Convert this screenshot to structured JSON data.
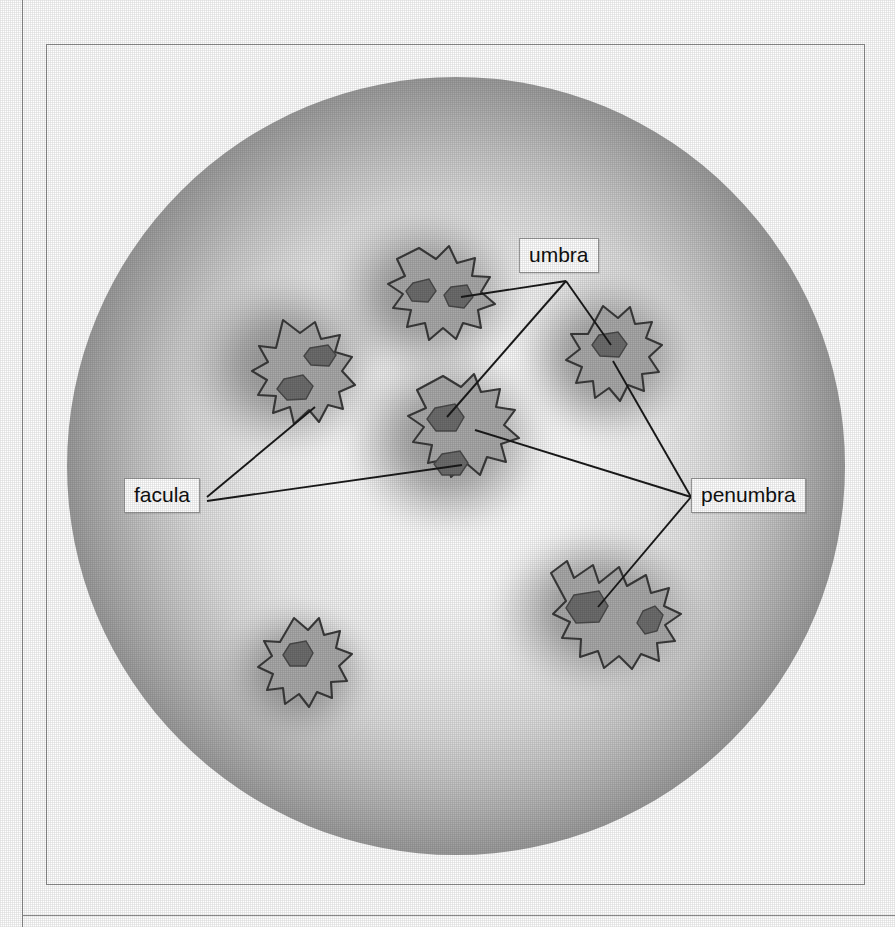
{
  "figure": {
    "kind": "solar-disk-sunspot-diagram",
    "disk": {
      "center_x": 456,
      "center_y": 466,
      "radius": 389,
      "limb_color": "#9a9a9a",
      "center_color": "#ffffff"
    },
    "colors": {
      "penumbra": "#a8a8a8",
      "umbra": "#6f6f6f",
      "outline": "#3a3a3a",
      "facula_halo": "#8f8f8f",
      "leader_line": "#1a1a1a",
      "frame": "#8f8f8f",
      "label_text": "#111111",
      "label_background": "#ffffff",
      "label_border": "#9a9a9a"
    }
  },
  "labels": [
    {
      "id": "umbra",
      "text": "umbra",
      "leader_count": 3
    },
    {
      "id": "facula",
      "text": "facula",
      "leader_count": 2
    },
    {
      "id": "penumbra",
      "text": "penumbra",
      "leader_count": 3
    }
  ],
  "sunspots": [
    {
      "id": "upper-left",
      "umbra_count": 2,
      "has_facula_halo": true,
      "labeled_by": [
        "facula"
      ]
    },
    {
      "id": "upper-middle",
      "umbra_count": 2,
      "has_facula_halo": true,
      "labeled_by": [
        "umbra"
      ]
    },
    {
      "id": "right",
      "umbra_count": 1,
      "has_facula_halo": true,
      "labeled_by": [
        "umbra",
        "penumbra"
      ]
    },
    {
      "id": "center",
      "umbra_count": 2,
      "has_facula_halo": true,
      "labeled_by": [
        "umbra",
        "penumbra",
        "facula"
      ]
    },
    {
      "id": "lower-right",
      "umbra_count": 2,
      "has_facula_halo": true,
      "labeled_by": [
        "penumbra"
      ]
    },
    {
      "id": "lower-left",
      "umbra_count": 1,
      "has_facula_halo": false,
      "labeled_by": []
    }
  ]
}
